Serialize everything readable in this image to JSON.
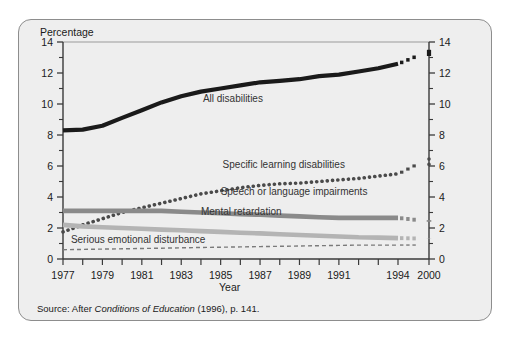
{
  "figure": {
    "top_fragment": "",
    "y_axis_title": "Percentage",
    "x_axis_title": "Year",
    "source_prefix": "Source: After ",
    "source_italic": "Conditions of Education",
    "source_suffix": " (1996), p. 141."
  },
  "colors": {
    "panel_background": "#eeeeee",
    "panel_border": "#8d8d8d",
    "axis": "#3a3a3a",
    "all_disabilities": "#1a1a1a",
    "specific_learning": "#4a4a4a",
    "speech_language": "#8a8a8a",
    "mental_retardation": "#b4b4b4",
    "serious_emotional": "#7a7a7a",
    "text": "#1a1a1a",
    "label_text": "#333333"
  },
  "chart_data": {
    "type": "line",
    "title": "",
    "xlabel": "Year",
    "ylabel": "Percentage",
    "ylim": [
      0,
      14
    ],
    "yticks": [
      0,
      2,
      4,
      6,
      8,
      10,
      12,
      14
    ],
    "yticks_minor": [
      1,
      3,
      5,
      7,
      9,
      11,
      13
    ],
    "y_axis_both_sides": true,
    "grid": false,
    "legend_position": "inline-annotations",
    "axis_break": {
      "between": [
        1994,
        2000
      ],
      "style": "dashed-gap"
    },
    "xticks": [
      1977,
      1978,
      1979,
      1980,
      1981,
      1982,
      1983,
      1984,
      1985,
      1986,
      1987,
      1988,
      1989,
      1990,
      1991,
      1992,
      1993,
      1994,
      2000
    ],
    "xticklabels": [
      "1977",
      "",
      "1979",
      "",
      "1981",
      "",
      "1983",
      "",
      "1985",
      "",
      "1987",
      "",
      "1989",
      "",
      "1991",
      "",
      "",
      "1994",
      "2000"
    ],
    "x": [
      1977,
      1978,
      1979,
      1980,
      1981,
      1982,
      1983,
      1984,
      1985,
      1986,
      1987,
      1988,
      1989,
      1990,
      1991,
      1992,
      1993,
      1994,
      2000
    ],
    "series": [
      {
        "name": "All disabilities",
        "label": "All disabilities",
        "style": "solid-thick",
        "color": "#1a1a1a",
        "label_x": 1984.1,
        "label_y": 10.15,
        "values": [
          8.3,
          8.35,
          8.6,
          9.1,
          9.6,
          10.1,
          10.5,
          10.8,
          11.0,
          11.2,
          11.4,
          11.5,
          11.6,
          11.8,
          11.9,
          12.1,
          12.3,
          12.6,
          13.5
        ]
      },
      {
        "name": "Specific learning disabilities",
        "label": "Specific learning disabilities",
        "style": "dotted",
        "color": "#4a4a4a",
        "label_x": 1985.1,
        "label_y": 5.85,
        "values": [
          1.75,
          2.2,
          2.6,
          3.0,
          3.3,
          3.6,
          3.9,
          4.2,
          4.4,
          4.6,
          4.75,
          4.85,
          4.9,
          5.0,
          5.1,
          5.2,
          5.35,
          5.5,
          6.6
        ]
      },
      {
        "name": "Speech or language impairments",
        "label": "Speech or language impairments",
        "style": "solid-band",
        "color": "#8a8a8a",
        "label_x": 1985.0,
        "label_y": 4.15,
        "values": [
          3.1,
          3.1,
          3.1,
          3.1,
          3.1,
          3.1,
          3.05,
          3.0,
          2.95,
          2.9,
          2.85,
          2.8,
          2.75,
          2.7,
          2.65,
          2.65,
          2.65,
          2.65,
          2.4
        ]
      },
      {
        "name": "Mental retardation",
        "label": "Mental retardation",
        "style": "solid-band",
        "color": "#b4b4b4",
        "label_x": 1984.0,
        "label_y": 2.85,
        "values": [
          2.2,
          2.1,
          2.05,
          2.0,
          1.95,
          1.9,
          1.85,
          1.8,
          1.75,
          1.7,
          1.65,
          1.6,
          1.55,
          1.5,
          1.45,
          1.4,
          1.38,
          1.35,
          1.3
        ]
      },
      {
        "name": "Serious emotional disturbance",
        "label": "Serious emotional disturbance",
        "style": "dashed-thin",
        "color": "#7a7a7a",
        "label_x": 1977.4,
        "label_y": 1.05,
        "values": [
          0.6,
          0.62,
          0.64,
          0.66,
          0.68,
          0.7,
          0.72,
          0.74,
          0.76,
          0.78,
          0.8,
          0.82,
          0.84,
          0.86,
          0.88,
          0.9,
          0.9,
          0.9,
          0.9
        ]
      }
    ]
  }
}
